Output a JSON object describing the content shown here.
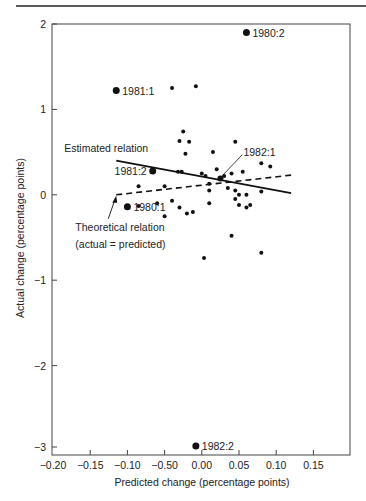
{
  "chart_data": {
    "type": "scatter",
    "title": "",
    "xlabel": "Predicted change (percentage points)",
    "ylabel": "Actual change (percentage points)",
    "xlim": [
      -0.2,
      0.2
    ],
    "ylim": [
      -3,
      2
    ],
    "grid": false,
    "x_ticks": [
      -0.2,
      -0.15,
      -0.1,
      -0.05,
      0.0,
      0.05,
      0.1,
      0.15
    ],
    "x_tick_labels": [
      "−0.20",
      "−0.15",
      "−0.10",
      "−0.50",
      "0.00",
      "0.05",
      "0.10",
      "0.15"
    ],
    "y_ticks": [
      2,
      1,
      0,
      -1,
      -2,
      -3
    ],
    "y_tick_labels": [
      "2",
      "1",
      "0",
      "−1",
      "−2",
      "−3"
    ],
    "labeled_points": [
      {
        "label": "1980:2",
        "x": 0.06,
        "y": 1.9
      },
      {
        "label": "1981:1",
        "x": -0.115,
        "y": 1.22
      },
      {
        "label": "1981:2",
        "x": -0.066,
        "y": 0.28
      },
      {
        "label": "1980:1",
        "x": -0.1,
        "y": -0.14
      },
      {
        "label": "1982:1",
        "x": 0.025,
        "y": 0.19
      },
      {
        "label": "1982:2",
        "x": -0.008,
        "y": -2.94
      }
    ],
    "points": [
      {
        "x": -0.04,
        "y": 1.25
      },
      {
        "x": -0.008,
        "y": 1.27
      },
      {
        "x": -0.025,
        "y": 0.74
      },
      {
        "x": -0.03,
        "y": 0.63
      },
      {
        "x": -0.017,
        "y": 0.62
      },
      {
        "x": -0.022,
        "y": 0.48
      },
      {
        "x": 0.015,
        "y": 0.5
      },
      {
        "x": 0.045,
        "y": 0.62
      },
      {
        "x": -0.032,
        "y": 0.27
      },
      {
        "x": -0.027,
        "y": 0.27
      },
      {
        "x": 0.0,
        "y": 0.25
      },
      {
        "x": 0.005,
        "y": 0.22
      },
      {
        "x": 0.02,
        "y": 0.3
      },
      {
        "x": 0.03,
        "y": 0.22
      },
      {
        "x": 0.04,
        "y": 0.25
      },
      {
        "x": 0.055,
        "y": 0.27
      },
      {
        "x": 0.08,
        "y": 0.37
      },
      {
        "x": 0.092,
        "y": 0.33
      },
      {
        "x": -0.085,
        "y": 0.1
      },
      {
        "x": -0.05,
        "y": 0.1
      },
      {
        "x": 0.01,
        "y": 0.05
      },
      {
        "x": 0.035,
        "y": 0.08
      },
      {
        "x": 0.045,
        "y": 0.05
      },
      {
        "x": 0.05,
        "y": 0.0
      },
      {
        "x": 0.06,
        "y": 0.0
      },
      {
        "x": 0.08,
        "y": 0.04
      },
      {
        "x": -0.085,
        "y": -0.13
      },
      {
        "x": -0.06,
        "y": -0.1
      },
      {
        "x": -0.04,
        "y": -0.07
      },
      {
        "x": -0.03,
        "y": -0.15
      },
      {
        "x": -0.02,
        "y": -0.22
      },
      {
        "x": -0.012,
        "y": -0.2
      },
      {
        "x": 0.01,
        "y": -0.1
      },
      {
        "x": 0.045,
        "y": -0.05
      },
      {
        "x": 0.05,
        "y": -0.12
      },
      {
        "x": 0.06,
        "y": -0.15
      },
      {
        "x": 0.065,
        "y": -0.12
      },
      {
        "x": -0.05,
        "y": -0.25
      },
      {
        "x": 0.04,
        "y": -0.48
      },
      {
        "x": 0.003,
        "y": -0.74
      },
      {
        "x": 0.08,
        "y": -0.68
      },
      {
        "x": 0.01,
        "y": 0.13
      }
    ],
    "lines": [
      {
        "name": "Estimated relation",
        "style": "solid",
        "x": [
          -0.115,
          0.12
        ],
        "y": [
          0.4,
          0.02
        ]
      },
      {
        "name": "Theoretical relation (actual = predicted)",
        "style": "dashed",
        "x": [
          -0.115,
          0.12
        ],
        "y": [
          0.0,
          0.23
        ]
      }
    ],
    "annotations": [
      {
        "text": "Estimated relation",
        "x": -0.185,
        "y": 0.5
      },
      {
        "text": "Theoretical relation",
        "x": -0.17,
        "y": -0.42
      },
      {
        "text": "(actual = predicted)",
        "x": -0.17,
        "y": -0.62
      }
    ]
  }
}
